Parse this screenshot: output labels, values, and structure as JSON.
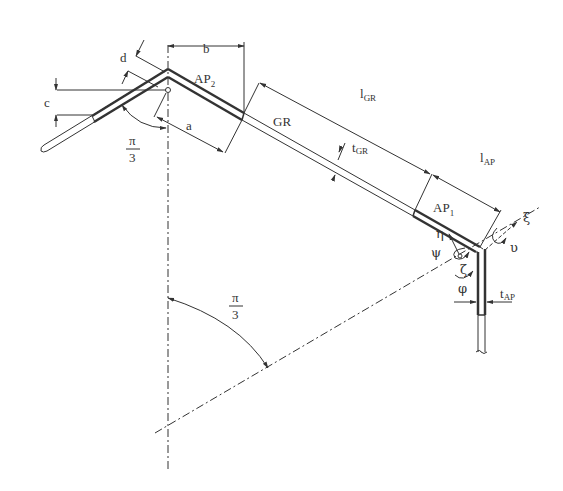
{
  "diagram": {
    "type": "technical-drawing",
    "members": [
      {
        "id": "AP2",
        "label": "AP",
        "sub": "2"
      },
      {
        "id": "GR",
        "label": "GR"
      },
      {
        "id": "AP1",
        "label": "AP",
        "sub": "1"
      }
    ],
    "dimensions": {
      "a": "a",
      "b": "b",
      "c": "c",
      "d": "d",
      "l_gr": {
        "label": "l",
        "sub": "GR"
      },
      "t_gr": {
        "label": "t",
        "sub": "GR"
      },
      "l_ap": {
        "label": "l",
        "sub": "AP"
      },
      "t_ap": {
        "label": "t",
        "sub": "AP"
      }
    },
    "angles": {
      "top": {
        "num": "π",
        "den": "3"
      },
      "bottom": {
        "num": "π",
        "den": "3"
      }
    },
    "axes": {
      "xi": "ξ",
      "eta": "η",
      "zeta": "ζ",
      "upsilon": "υ",
      "psi": "ψ",
      "phi": "φ"
    },
    "colors": {
      "line": "#333333",
      "background": "#ffffff"
    }
  }
}
